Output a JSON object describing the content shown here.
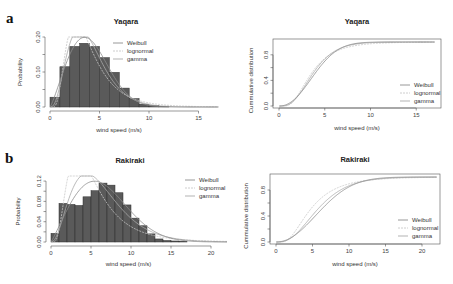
{
  "figure": {
    "panels": [
      {
        "letter": "a",
        "site": "Yaqara"
      },
      {
        "letter": "b",
        "site": "Rakiraki"
      }
    ]
  },
  "colors": {
    "bar_fill": "#5a5a5a",
    "bar_stroke": "#2e2e2e",
    "weibull": "#8c8c8c",
    "lognormal": "#c8c8c8",
    "gamma": "#aaaaaa",
    "axis": "#555555"
  },
  "chart_data": [
    {
      "id": "a-hist",
      "type": "bar",
      "title": "Yaqara",
      "panel_label": "a",
      "xlabel": "wind speed (m/s)",
      "ylabel": "Probability",
      "xlim": [
        0,
        17
      ],
      "ylim": [
        0,
        0.2
      ],
      "xticks": [
        0,
        5,
        10,
        15
      ],
      "yticks": [
        "0.00",
        "0.10",
        "0.20"
      ],
      "yticks_values": [
        0,
        0.1,
        0.2
      ],
      "bin_width": 1,
      "bin_edges_start": 0,
      "values": [
        0.028,
        0.115,
        0.173,
        0.182,
        0.173,
        0.141,
        0.099,
        0.054,
        0.024,
        0.008,
        0.004,
        0.002
      ],
      "legend": [
        "Weibull",
        "lognormal",
        "gamma"
      ],
      "legend_position": "top-right",
      "fits": {
        "Weibull": {
          "k": 2.2,
          "c": 4.6
        },
        "lognormal": {
          "meanlog": 1.25,
          "sdlog": 0.55
        },
        "gamma": {
          "shape": 4.0,
          "scale": 1.0
        }
      }
    },
    {
      "id": "a-cdf",
      "type": "line",
      "title": "Yaqara",
      "xlabel": "wind speed (m/s)",
      "ylabel": "Cummulative distribution",
      "xlim": [
        0,
        17
      ],
      "ylim": [
        0,
        1
      ],
      "xticks": [
        0,
        5,
        10,
        15
      ],
      "yticks": [
        "0.0",
        "0.4",
        "0.8"
      ],
      "yticks_values": [
        0,
        0.4,
        0.8
      ],
      "series": [
        {
          "name": "Weibull"
        },
        {
          "name": "lognormal"
        },
        {
          "name": "gamma"
        }
      ],
      "legend": [
        "Weibull",
        "lognormal",
        "gamma"
      ],
      "legend_position": "bottom-right"
    },
    {
      "id": "b-hist",
      "type": "bar",
      "title": "Rakiraki",
      "panel_label": "b",
      "xlabel": "wind speed (m/s)",
      "ylabel": "Probability",
      "xlim": [
        0,
        22
      ],
      "ylim": [
        0,
        0.13
      ],
      "xticks": [
        0,
        5,
        10,
        15,
        20
      ],
      "yticks": [
        "0.00",
        "0.04",
        "0.08",
        "0.12"
      ],
      "yticks_values": [
        0,
        0.04,
        0.08,
        0.12
      ],
      "bin_width": 1,
      "bin_edges_start": 0,
      "values": [
        0.017,
        0.076,
        0.074,
        0.072,
        0.089,
        0.101,
        0.116,
        0.112,
        0.097,
        0.073,
        0.047,
        0.032,
        0.016,
        0.006,
        0.003,
        0.002,
        0.001
      ],
      "legend": [
        "Weibull",
        "lognormal",
        "gamma"
      ],
      "legend_position": "top-right",
      "fits": {
        "Weibull": {
          "k": 2.1,
          "c": 7.4
        },
        "lognormal": {
          "meanlog": 1.55,
          "sdlog": 0.6
        },
        "gamma": {
          "shape": 3.4,
          "scale": 1.85
        }
      }
    },
    {
      "id": "b-cdf",
      "type": "line",
      "title": "Rakiraki",
      "xlabel": "wind speed (m/s)",
      "ylabel": "Cummulative distribution",
      "xlim": [
        0,
        22
      ],
      "ylim": [
        0,
        1
      ],
      "xticks": [
        0,
        5,
        10,
        15,
        20
      ],
      "yticks": [
        "0.0",
        "0.4",
        "0.8"
      ],
      "yticks_values": [
        0,
        0.4,
        0.8
      ],
      "series": [
        {
          "name": "Weibull"
        },
        {
          "name": "lognormal"
        },
        {
          "name": "gamma"
        }
      ],
      "legend": [
        "Weibull",
        "lognormal",
        "gamma"
      ],
      "legend_position": "bottom-right"
    }
  ]
}
